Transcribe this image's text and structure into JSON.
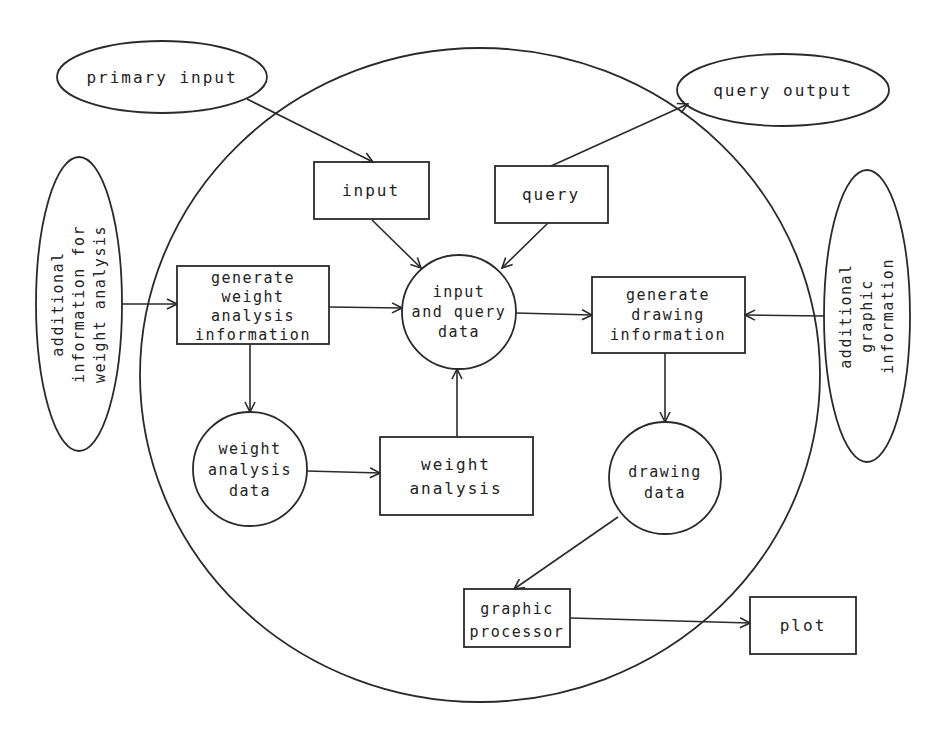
{
  "diagram": {
    "boundary": {
      "label": ""
    },
    "externals": {
      "primary_input": {
        "label": "primary input"
      },
      "query_output": {
        "label": "query output"
      },
      "additional_weight_info": {
        "lines": [
          "additional",
          "information for",
          "weight analysis"
        ]
      },
      "additional_graphic_info": {
        "lines": [
          "additional",
          "graphic",
          "information"
        ]
      },
      "plot": {
        "label": "plot"
      }
    },
    "processes": {
      "input": {
        "label": "input"
      },
      "query": {
        "label": "query"
      },
      "generate_weight_analysis_information": {
        "lines": [
          "generate",
          "weight",
          "analysis",
          "information"
        ]
      },
      "weight_analysis": {
        "lines": [
          "weight",
          "analysis"
        ]
      },
      "generate_drawing_information": {
        "lines": [
          "generate",
          "drawing",
          "information"
        ]
      },
      "graphic_processor": {
        "lines": [
          "graphic",
          "processor"
        ]
      }
    },
    "data_stores": {
      "input_and_query_data": {
        "lines": [
          "input",
          "and query",
          "data"
        ]
      },
      "weight_analysis_data": {
        "lines": [
          "weight",
          "analysis",
          "data"
        ]
      },
      "drawing_data": {
        "lines": [
          "drawing",
          "data"
        ]
      }
    },
    "flows": [
      {
        "from": "primary input",
        "to": "input"
      },
      {
        "from": "query",
        "to": "query output"
      },
      {
        "from": "input",
        "to": "input and query data"
      },
      {
        "from": "query",
        "to": "input and query data"
      },
      {
        "from": "additional information for weight analysis",
        "to": "generate weight analysis information"
      },
      {
        "from": "generate weight analysis information",
        "to": "input and query data"
      },
      {
        "from": "generate weight analysis information",
        "to": "weight analysis data"
      },
      {
        "from": "weight analysis data",
        "to": "weight analysis"
      },
      {
        "from": "weight analysis",
        "to": "input and query data"
      },
      {
        "from": "input and query data",
        "to": "generate drawing information"
      },
      {
        "from": "additional graphic information",
        "to": "generate drawing information"
      },
      {
        "from": "generate drawing information",
        "to": "drawing data"
      },
      {
        "from": "drawing data",
        "to": "graphic processor"
      },
      {
        "from": "graphic processor",
        "to": "plot"
      }
    ]
  }
}
